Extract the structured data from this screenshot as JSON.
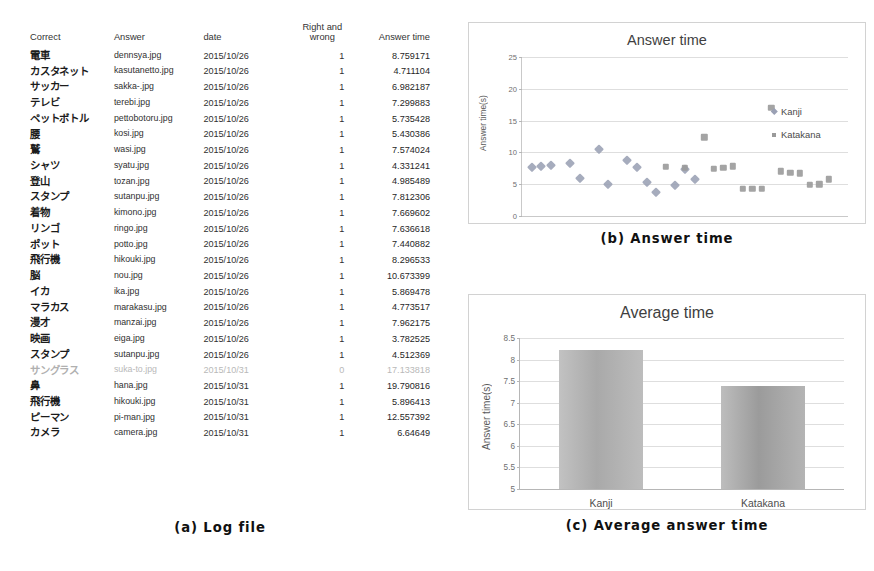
{
  "figure": {
    "caption_a": "(a) Log file",
    "caption_b": "(b) Answer time",
    "caption_c": "(c) Average answer time"
  },
  "log_file": {
    "headers": {
      "correct": "Correct",
      "answer": "Answer",
      "date": "date",
      "right_and_wrong": "Right and wrong",
      "right_and_wrong_line1": "Right and",
      "right_and_wrong_line2": "wrong",
      "answer_time": "Answer time"
    },
    "rows": [
      {
        "correct": "電車",
        "answer": "dennsya.jpg",
        "date": "2015/10/26",
        "rw": "1",
        "time": "8.759171",
        "dim": false
      },
      {
        "correct": "カスタネット",
        "answer": "kasutanetto.jpg",
        "date": "2015/10/26",
        "rw": "1",
        "time": "4.711104",
        "dim": false
      },
      {
        "correct": "サッカー",
        "answer": "sakka-.jpg",
        "date": "2015/10/26",
        "rw": "1",
        "time": "6.982187",
        "dim": false
      },
      {
        "correct": "テレビ",
        "answer": "terebi.jpg",
        "date": "2015/10/26",
        "rw": "1",
        "time": "7.299883",
        "dim": false
      },
      {
        "correct": "ペットボトル",
        "answer": "pettobotoru.jpg",
        "date": "2015/10/26",
        "rw": "1",
        "time": "5.735428",
        "dim": false
      },
      {
        "correct": "腰",
        "answer": "kosi.jpg",
        "date": "2015/10/26",
        "rw": "1",
        "time": "5.430386",
        "dim": false
      },
      {
        "correct": "鷲",
        "answer": "wasi.jpg",
        "date": "2015/10/26",
        "rw": "1",
        "time": "7.574024",
        "dim": false
      },
      {
        "correct": "シャツ",
        "answer": "syatu.jpg",
        "date": "2015/10/26",
        "rw": "1",
        "time": "4.331241",
        "dim": false
      },
      {
        "correct": "登山",
        "answer": "tozan.jpg",
        "date": "2015/10/26",
        "rw": "1",
        "time": "4.985489",
        "dim": false
      },
      {
        "correct": "スタンプ",
        "answer": "sutanpu.jpg",
        "date": "2015/10/26",
        "rw": "1",
        "time": "7.812306",
        "dim": false
      },
      {
        "correct": "着物",
        "answer": "kimono.jpg",
        "date": "2015/10/26",
        "rw": "1",
        "time": "7.669602",
        "dim": false
      },
      {
        "correct": "リンゴ",
        "answer": "ringo.jpg",
        "date": "2015/10/26",
        "rw": "1",
        "time": "7.636618",
        "dim": false
      },
      {
        "correct": "ポット",
        "answer": "potto.jpg",
        "date": "2015/10/26",
        "rw": "1",
        "time": "7.440882",
        "dim": false
      },
      {
        "correct": "飛行機",
        "answer": "hikouki.jpg",
        "date": "2015/10/26",
        "rw": "1",
        "time": "8.296533",
        "dim": false
      },
      {
        "correct": "脳",
        "answer": "nou.jpg",
        "date": "2015/10/26",
        "rw": "1",
        "time": "10.673399",
        "dim": false
      },
      {
        "correct": "イカ",
        "answer": "ika.jpg",
        "date": "2015/10/26",
        "rw": "1",
        "time": "5.869478",
        "dim": false
      },
      {
        "correct": "マラカス",
        "answer": "marakasu.jpg",
        "date": "2015/10/26",
        "rw": "1",
        "time": "4.773517",
        "dim": false
      },
      {
        "correct": "漫才",
        "answer": "manzai.jpg",
        "date": "2015/10/26",
        "rw": "1",
        "time": "7.962175",
        "dim": false
      },
      {
        "correct": "映画",
        "answer": "eiga.jpg",
        "date": "2015/10/26",
        "rw": "1",
        "time": "3.782525",
        "dim": false
      },
      {
        "correct": "スタンプ",
        "answer": "sutanpu.jpg",
        "date": "2015/10/26",
        "rw": "1",
        "time": "4.512369",
        "dim": false
      },
      {
        "correct": "サングラス",
        "answer": "suka-to.jpg",
        "date": "2015/10/31",
        "rw": "0",
        "time": "17.133818",
        "dim": true
      },
      {
        "correct": "鼻",
        "answer": "hana.jpg",
        "date": "2015/10/31",
        "rw": "1",
        "time": "19.790816",
        "dim": false
      },
      {
        "correct": "飛行機",
        "answer": "hikouki.jpg",
        "date": "2015/10/31",
        "rw": "1",
        "time": "5.896413",
        "dim": false
      },
      {
        "correct": "ピーマン",
        "answer": "pi-man.jpg",
        "date": "2015/10/31",
        "rw": "1",
        "time": "12.557392",
        "dim": false
      },
      {
        "correct": "カメラ",
        "answer": "camera.jpg",
        "date": "2015/10/31",
        "rw": "1",
        "time": "6.64649",
        "dim": false
      }
    ]
  },
  "chart_data": [
    {
      "id": "answer_time_scatter",
      "type": "scatter",
      "title": "Answer time",
      "xlabel": "",
      "ylabel": "Answer time(s)",
      "ylim": [
        0,
        25
      ],
      "yticks": [
        "0",
        "5",
        "10",
        "15",
        "20",
        "25"
      ],
      "grid": true,
      "legend_position": "right",
      "series": [
        {
          "name": "Kanji",
          "marker": "diamond",
          "color": "#9aa0b4",
          "points": [
            {
              "x": 1,
              "y": 7.7
            },
            {
              "x": 2,
              "y": 7.8
            },
            {
              "x": 3,
              "y": 8.0
            },
            {
              "x": 5,
              "y": 8.3
            },
            {
              "x": 6,
              "y": 5.9
            },
            {
              "x": 8,
              "y": 10.5
            },
            {
              "x": 9,
              "y": 5.1
            },
            {
              "x": 11,
              "y": 8.8
            },
            {
              "x": 12,
              "y": 7.7
            },
            {
              "x": 13,
              "y": 5.4
            },
            {
              "x": 14,
              "y": 3.8
            },
            {
              "x": 16,
              "y": 4.8
            },
            {
              "x": 17,
              "y": 7.4
            },
            {
              "x": 18,
              "y": 5.8
            }
          ]
        },
        {
          "name": "Katakana",
          "marker": "square",
          "color": "#9a9a9a",
          "points": [
            {
              "x": 15,
              "y": 7.7
            },
            {
              "x": 17,
              "y": 7.6
            },
            {
              "x": 19,
              "y": 12.4
            },
            {
              "x": 20,
              "y": 7.4
            },
            {
              "x": 21,
              "y": 7.6
            },
            {
              "x": 22,
              "y": 7.8
            },
            {
              "x": 23,
              "y": 4.3
            },
            {
              "x": 24,
              "y": 4.3
            },
            {
              "x": 25,
              "y": 4.3
            },
            {
              "x": 26,
              "y": 17.0
            },
            {
              "x": 27,
              "y": 7.0
            },
            {
              "x": 28,
              "y": 6.8
            },
            {
              "x": 29,
              "y": 6.7
            },
            {
              "x": 30,
              "y": 4.9
            },
            {
              "x": 31,
              "y": 5.0
            },
            {
              "x": 32,
              "y": 5.8
            }
          ]
        }
      ],
      "xrange": [
        0,
        34
      ]
    },
    {
      "id": "average_time_bar",
      "type": "bar",
      "title": "Average time",
      "xlabel": "",
      "ylabel": "Answer time(s)",
      "ylim": [
        5,
        8.5
      ],
      "yticks": [
        "5",
        "5.5",
        "6",
        "6.5",
        "7",
        "7.5",
        "8",
        "8.5"
      ],
      "grid": true,
      "categories": [
        "Kanji",
        "Katakana"
      ],
      "values": [
        8.22,
        7.38
      ]
    }
  ]
}
